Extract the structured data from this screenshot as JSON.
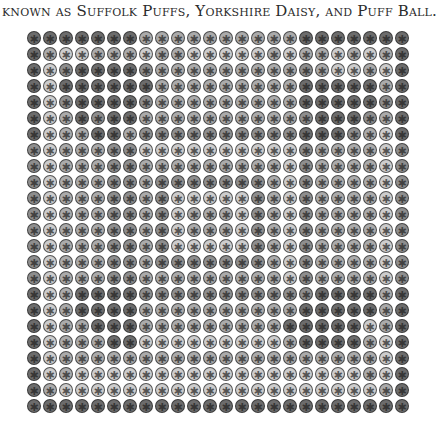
{
  "caption": {
    "text": "known as Suffolk Puffs, Yorkshire Daisy, and Puff Ball."
  },
  "quilt": {
    "description": "Photograph of a grayscale yo-yo quilt, 24 x 24 yo-yos",
    "columns": 24,
    "rows": 24,
    "pitch_px": 16,
    "disc_px": 14,
    "center_glyph": "✱",
    "shades": [
      "#cdcdcd",
      "#ababab",
      "#8e8e8e",
      "#6c6c6c"
    ],
    "tone_rows": [
      "333333311111111113333333",
      "310011101100000101101013",
      "302333321111111112100103",
      "303333331111111113333313",
      "302333321111111113333323",
      "301323311111111112333213",
      "301133122222222223332103",
      "201112200000000002111102",
      "201112211111111102111102",
      "201112212222222102111102",
      "201112212000002102111102",
      "201112212011102102111102",
      "201112212011102102111102",
      "201112212000002102111102",
      "201112212222222102111102",
      "201112211111111102111102",
      "301333322222222222333313",
      "301333311111111113333313",
      "301133311111111133333013",
      "301113300000000013333103",
      "301111111111111111111103",
      "301000000000000000000103",
      "310000000000000000000013",
      "333333333333333333333333"
    ]
  }
}
